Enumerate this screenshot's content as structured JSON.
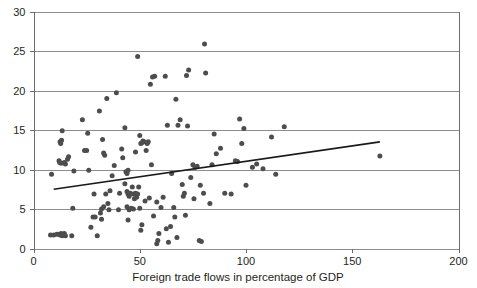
{
  "chart_data": {
    "type": "scatter",
    "title": "",
    "xlabel": "Foreign trade flows in percentage of GDP",
    "ylabel": "",
    "xlim": [
      0,
      200
    ],
    "ylim": [
      0,
      30
    ],
    "x_ticks": [
      0,
      50,
      100,
      150,
      200
    ],
    "y_ticks": [
      0,
      5,
      10,
      15,
      20,
      25,
      30
    ],
    "x_tick_labels": [
      "0",
      "50",
      "100",
      "150",
      "200"
    ],
    "y_tick_labels": [
      "0",
      "5",
      "10",
      "15",
      "20",
      "25",
      "30"
    ],
    "grid": "horizontal",
    "legend": "none",
    "point_color": "#4d4d4d",
    "grid_color": "#8c8c8c",
    "axis_color": "#6d6d6d",
    "trend_color": "#1a1a1a",
    "series": [
      {
        "name": "countries",
        "marker": "circle",
        "points": [
          [
            8.5,
            9.4
          ],
          [
            8.0,
            1.7
          ],
          [
            9.5,
            1.7
          ],
          [
            11.0,
            1.8
          ],
          [
            12.0,
            1.8
          ],
          [
            12.5,
            1.7
          ],
          [
            13.0,
            1.9
          ],
          [
            13.5,
            1.6
          ],
          [
            14.5,
            1.9
          ],
          [
            15.0,
            1.6
          ],
          [
            18.0,
            1.6
          ],
          [
            12.5,
            13.5
          ],
          [
            12.8,
            13.3
          ],
          [
            13.2,
            13.7
          ],
          [
            12.0,
            11.1
          ],
          [
            12.3,
            10.9
          ],
          [
            13.0,
            10.8
          ],
          [
            14.5,
            10.9
          ],
          [
            15.0,
            10.7
          ],
          [
            13.5,
            14.9
          ],
          [
            16.5,
            11.6
          ],
          [
            16.0,
            11.3
          ],
          [
            19.0,
            9.8
          ],
          [
            18.5,
            5.1
          ],
          [
            24.0,
            12.4
          ],
          [
            23.0,
            16.3
          ],
          [
            25.5,
            14.6
          ],
          [
            26.0,
            9.9
          ],
          [
            25.0,
            12.4
          ],
          [
            27.0,
            2.7
          ],
          [
            28.0,
            4.0
          ],
          [
            29.0,
            4.0
          ],
          [
            28.5,
            6.9
          ],
          [
            30.0,
            1.6
          ],
          [
            31.0,
            17.4
          ],
          [
            33.0,
            12.1
          ],
          [
            33.5,
            11.8
          ],
          [
            32.5,
            13.8
          ],
          [
            31.5,
            4.5
          ],
          [
            32.0,
            5.0
          ],
          [
            33.0,
            5.3
          ],
          [
            32.0,
            3.7
          ],
          [
            34.0,
            6.9
          ],
          [
            34.5,
            19.0
          ],
          [
            35.0,
            5.7
          ],
          [
            36.0,
            7.3
          ],
          [
            35.5,
            4.9
          ],
          [
            37.0,
            9.2
          ],
          [
            38.0,
            10.5
          ],
          [
            39.0,
            19.7
          ],
          [
            40.0,
            4.9
          ],
          [
            40.5,
            7.0
          ],
          [
            41.5,
            12.6
          ],
          [
            42.0,
            11.5
          ],
          [
            43.0,
            15.3
          ],
          [
            43.5,
            9.7
          ],
          [
            44.0,
            9.5
          ],
          [
            44.5,
            9.9
          ],
          [
            43.0,
            8.2
          ],
          [
            44.0,
            7.2
          ],
          [
            44.5,
            6.9
          ],
          [
            45.0,
            6.6
          ],
          [
            45.5,
            7.0
          ],
          [
            44.0,
            5.3
          ],
          [
            45.0,
            4.9
          ],
          [
            46.0,
            5.1
          ],
          [
            44.5,
            3.6
          ],
          [
            46.5,
            7.8
          ],
          [
            47.0,
            6.9
          ],
          [
            47.5,
            6.3
          ],
          [
            47.0,
            5.0
          ],
          [
            48.0,
            7.0
          ],
          [
            48.5,
            6.5
          ],
          [
            49.0,
            6.9
          ],
          [
            49.5,
            7.8
          ],
          [
            48.0,
            12.2
          ],
          [
            49.0,
            24.3
          ],
          [
            50.0,
            14.3
          ],
          [
            50.5,
            13.3
          ],
          [
            51.0,
            13.4
          ],
          [
            51.5,
            13.6
          ],
          [
            52.0,
            13.5
          ],
          [
            50.0,
            5.1
          ],
          [
            51.0,
            3.0
          ],
          [
            50.5,
            2.3
          ],
          [
            53.0,
            12.4
          ],
          [
            53.5,
            13.3
          ],
          [
            54.0,
            13.5
          ],
          [
            54.5,
            6.4
          ],
          [
            52.5,
            6.0
          ],
          [
            55.0,
            20.8
          ],
          [
            56.0,
            21.7
          ],
          [
            57.0,
            21.8
          ],
          [
            55.5,
            10.6
          ],
          [
            56.5,
            4.1
          ],
          [
            58.0,
            0.6
          ],
          [
            58.5,
            1.0
          ],
          [
            58.0,
            5.9
          ],
          [
            59.0,
            1.9
          ],
          [
            60.0,
            5.2
          ],
          [
            61.0,
            6.5
          ],
          [
            62.0,
            21.8
          ],
          [
            63.0,
            15.6
          ],
          [
            62.5,
            2.5
          ],
          [
            63.5,
            0.8
          ],
          [
            65.0,
            9.5
          ],
          [
            66.0,
            5.2
          ],
          [
            66.5,
            4.0
          ],
          [
            64.5,
            2.8
          ],
          [
            67.0,
            18.9
          ],
          [
            68.0,
            15.6
          ],
          [
            69.0,
            16.3
          ],
          [
            67.5,
            1.4
          ],
          [
            70.0,
            8.1
          ],
          [
            70.5,
            6.6
          ],
          [
            71.0,
            7.0
          ],
          [
            71.5,
            4.2
          ],
          [
            72.0,
            21.9
          ],
          [
            73.0,
            22.6
          ],
          [
            72.5,
            15.5
          ],
          [
            74.0,
            9.0
          ],
          [
            75.0,
            10.6
          ],
          [
            76.0,
            10.3
          ],
          [
            77.0,
            10.4
          ],
          [
            75.5,
            6.3
          ],
          [
            78.0,
            1.0
          ],
          [
            79.0,
            0.9
          ],
          [
            78.5,
            8.0
          ],
          [
            80.0,
            7.0
          ],
          [
            81.0,
            22.2
          ],
          [
            80.5,
            25.9
          ],
          [
            83.0,
            5.7
          ],
          [
            84.0,
            10.6
          ],
          [
            85.0,
            14.5
          ],
          [
            86.0,
            12.0
          ],
          [
            88.0,
            12.7
          ],
          [
            90.0,
            7.0
          ],
          [
            93.0,
            6.9
          ],
          [
            95.0,
            11.1
          ],
          [
            96.0,
            11.0
          ],
          [
            97.0,
            16.4
          ],
          [
            98.0,
            13.3
          ],
          [
            99.0,
            15.2
          ],
          [
            100.0,
            8.0
          ],
          [
            103.0,
            10.3
          ],
          [
            105.0,
            10.7
          ],
          [
            108.0,
            10.1
          ],
          [
            112.0,
            14.1
          ],
          [
            114.0,
            9.4
          ],
          [
            118.0,
            15.4
          ],
          [
            163.0,
            11.7
          ]
        ]
      }
    ],
    "trend_line": {
      "name": "linear fit",
      "x_start": 9.5,
      "y_start": 7.5,
      "x_end": 163.0,
      "y_end": 13.5
    }
  },
  "axis": {
    "x_title": "Foreign trade flows in percentage of GDP"
  }
}
